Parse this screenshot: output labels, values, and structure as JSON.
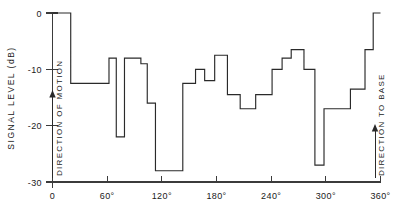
{
  "chart_data": {
    "type": "line",
    "subtype": "step-post",
    "title": "",
    "xlabel": "",
    "ylabel": "SIGNAL LEVEL (dB)",
    "xlim": [
      0,
      360
    ],
    "ylim": [
      -30,
      0
    ],
    "grid": false,
    "legend": null,
    "x_tick_labels": [
      "0",
      "60°",
      "120°",
      "180°",
      "240°",
      "300°",
      "360°"
    ],
    "x_tick_values": [
      0,
      60,
      120,
      180,
      240,
      300,
      360
    ],
    "y_tick_labels": [
      "0",
      "-10",
      "-20",
      "-30"
    ],
    "y_tick_values": [
      0,
      -10,
      -20,
      -30
    ],
    "series": [
      {
        "name": "signal level",
        "x": [
          0,
          20,
          20,
          62,
          62,
          70,
          70,
          79,
          79,
          88,
          88,
          97,
          97,
          104,
          104,
          113,
          113,
          125,
          125,
          143,
          143,
          157,
          157,
          167,
          167,
          178,
          178,
          192,
          192,
          206,
          206,
          223,
          223,
          241,
          241,
          252,
          252,
          262,
          262,
          276,
          276,
          288,
          288,
          298,
          298,
          308,
          308,
          327,
          327,
          343,
          343,
          352,
          352,
          360
        ],
        "y": [
          0,
          0,
          -12.5,
          -12.5,
          -8,
          -8,
          -22,
          -22,
          -8,
          -8,
          -8,
          -8,
          -9,
          -9,
          -16,
          -16,
          -28,
          -28,
          -28,
          -28,
          -12.5,
          -12.5,
          -10,
          -10,
          -12,
          -12,
          -7.5,
          -7.5,
          -14.5,
          -14.5,
          -17,
          -17,
          -14.5,
          -14.5,
          -10,
          -10,
          -8,
          -8,
          -6.5,
          -6.5,
          -10,
          -10,
          -27,
          -27,
          -17,
          -17,
          -17,
          -17,
          -13.5,
          -13.5,
          -6.5,
          -6.5,
          0,
          0
        ],
        "steps": [
          {
            "x_start": 0,
            "x_end": 20,
            "level_db": 0
          },
          {
            "x_start": 20,
            "x_end": 62,
            "level_db": -12.5
          },
          {
            "x_start": 62,
            "x_end": 70,
            "level_db": -8
          },
          {
            "x_start": 70,
            "x_end": 79,
            "level_db": -22
          },
          {
            "x_start": 79,
            "x_end": 97,
            "level_db": -8
          },
          {
            "x_start": 97,
            "x_end": 104,
            "level_db": -9
          },
          {
            "x_start": 104,
            "x_end": 113,
            "level_db": -16
          },
          {
            "x_start": 113,
            "x_end": 143,
            "level_db": -28
          },
          {
            "x_start": 143,
            "x_end": 157,
            "level_db": -12.5
          },
          {
            "x_start": 157,
            "x_end": 167,
            "level_db": -10
          },
          {
            "x_start": 167,
            "x_end": 178,
            "level_db": -12
          },
          {
            "x_start": 178,
            "x_end": 192,
            "level_db": -7.5
          },
          {
            "x_start": 192,
            "x_end": 206,
            "level_db": -14.5
          },
          {
            "x_start": 206,
            "x_end": 223,
            "level_db": -17
          },
          {
            "x_start": 223,
            "x_end": 241,
            "level_db": -14.5
          },
          {
            "x_start": 241,
            "x_end": 252,
            "level_db": -10
          },
          {
            "x_start": 252,
            "x_end": 262,
            "level_db": -8
          },
          {
            "x_start": 262,
            "x_end": 276,
            "level_db": -6.5
          },
          {
            "x_start": 276,
            "x_end": 288,
            "level_db": -10
          },
          {
            "x_start": 288,
            "x_end": 298,
            "level_db": -27
          },
          {
            "x_start": 298,
            "x_end": 327,
            "level_db": -17
          },
          {
            "x_start": 327,
            "x_end": 343,
            "level_db": -13.5
          },
          {
            "x_start": 343,
            "x_end": 352,
            "level_db": -6.5
          },
          {
            "x_start": 352,
            "x_end": 360,
            "level_db": 0
          }
        ]
      }
    ],
    "annotations": [
      {
        "id": "direction-of-motion",
        "label": "DIRECTION OF MOTION",
        "x_deg": 0,
        "marker": "up-arrow"
      },
      {
        "id": "direction-to-base",
        "label": "DIRECTION TO BASE",
        "x_deg": 355,
        "marker": "up-arrow"
      }
    ]
  }
}
